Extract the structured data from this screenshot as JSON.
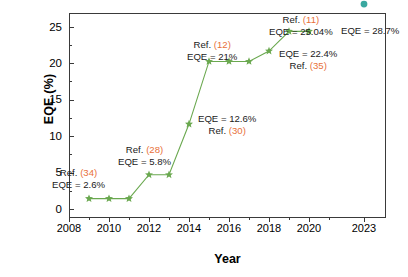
{
  "chart_data": {
    "type": "scatter",
    "title": "",
    "xlabel": "Year",
    "ylabel": "EQE (%)",
    "xlim": [
      2008,
      2023.6
    ],
    "ylim": [
      0,
      27.5
    ],
    "grid": false,
    "legend_position": "none",
    "x_ticks": [
      "2008",
      "2010",
      "2012",
      "2014",
      "2016",
      "2018",
      "2020",
      "2023"
    ],
    "x_tick_values": [
      2008,
      2010,
      2012,
      2014,
      2016,
      2018,
      2020,
      2023
    ],
    "y_ticks": [
      "0",
      "5",
      "10",
      "15",
      "20",
      "25"
    ],
    "y_tick_values": [
      0,
      5,
      10,
      15,
      20,
      25
    ],
    "series": [
      {
        "name": "EQE progress",
        "marker": "star",
        "color": "#6aa84f",
        "line": true,
        "x": [
          2009,
          2010,
          2011,
          2012,
          2013,
          2014,
          2015,
          2016,
          2017,
          2018,
          2019,
          2020
        ],
        "y": [
          2.6,
          2.6,
          2.6,
          5.8,
          5.8,
          12.6,
          21.0,
          21.0,
          21.0,
          22.4,
          25.04,
          25.04
        ]
      },
      {
        "name": "Record EQE",
        "marker": "circle",
        "color": "#3aa8a0",
        "line": false,
        "x": [
          2023
        ],
        "y": [
          28.7
        ]
      }
    ],
    "annotations": [
      {
        "ref": "(34)",
        "eqe": "EQE = 2.6%",
        "ref_label": "Ref. ",
        "order": "ref-first"
      },
      {
        "ref": "(28)",
        "eqe": "EQE = 5.8%",
        "ref_label": "Ref. ",
        "order": "ref-first"
      },
      {
        "ref": "(30)",
        "eqe": "EQE = 12.6%",
        "ref_label": "Ref. ",
        "order": "eqe-first"
      },
      {
        "ref": "(12)",
        "eqe": "EQE = 21%",
        "ref_label": "Ref. ",
        "order": "ref-first"
      },
      {
        "ref": "(35)",
        "eqe": "EQE = 22.4%",
        "ref_label": "Ref. ",
        "order": "eqe-first"
      },
      {
        "ref": "(11)",
        "eqe": "EQE = 25.04%",
        "ref_label": "Ref. ",
        "order": "ref-first"
      },
      {
        "ref": "",
        "eqe": "EQE = 28.7%",
        "ref_label": "",
        "order": "eqe-only"
      }
    ]
  },
  "axes": {
    "ylabel": "EQE (%)",
    "xlabel": "Year",
    "y_ticks": [
      "25",
      "20",
      "15",
      "10",
      "5",
      "0"
    ],
    "x_ticks": [
      "2008",
      "2010",
      "2012",
      "2014",
      "2016",
      "2018",
      "2020",
      "2023"
    ]
  },
  "annotations": {
    "a34": {
      "ref_label": "Ref. ",
      "ref_num": "(34)",
      "value": "EQE = 2.6%"
    },
    "a28": {
      "ref_label": "Ref. ",
      "ref_num": "(28)",
      "value": "EQE = 5.8%"
    },
    "a30": {
      "ref_label": "Ref. ",
      "ref_num": "(30)",
      "value": "EQE = 12.6%"
    },
    "a12": {
      "ref_label": "Ref. ",
      "ref_num": "(12)",
      "value": "EQE = 21%"
    },
    "a35": {
      "ref_label": "Ref. ",
      "ref_num": "(35)",
      "value": "EQE = 22.4%"
    },
    "a11": {
      "ref_label": "Ref. ",
      "ref_num": "(11)",
      "value": "EQE = 25.04%"
    },
    "a_last": {
      "value": "EQE = 28.7%"
    }
  },
  "colors": {
    "series_green": "#6aa84f",
    "series_teal": "#3aa8a0",
    "ref_orange": "#e8703a",
    "axis": "#3a3a3a"
  }
}
